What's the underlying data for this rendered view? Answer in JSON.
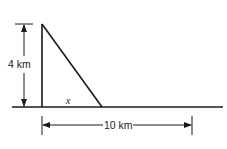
{
  "diagram": {
    "type": "right-triangle-distance",
    "labels": {
      "height": "4 km",
      "base_distance": "10 km",
      "variable": "x"
    },
    "colors": {
      "stroke": "#1a1a1a",
      "background": "#ffffff"
    }
  }
}
